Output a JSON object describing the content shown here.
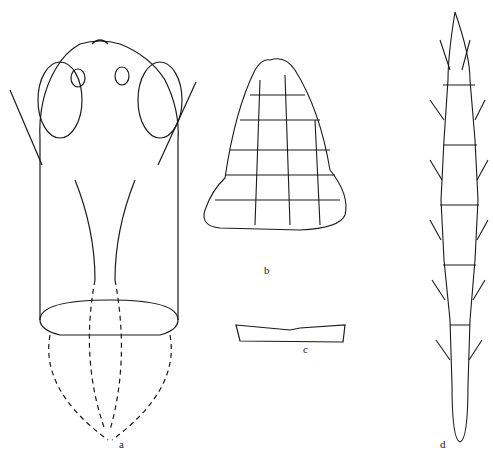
{
  "figure": {
    "panels": [
      {
        "id": "a",
        "label": "a",
        "description": "head and thorax, dorsal view"
      },
      {
        "id": "b",
        "label": "b",
        "description": "sculptured plate"
      },
      {
        "id": "c",
        "label": "c",
        "description": "narrow sclerite"
      },
      {
        "id": "d",
        "label": "d",
        "description": "antenna"
      }
    ],
    "colors": {
      "ink": "#1a1a1a",
      "paper": "#ffffff"
    }
  }
}
